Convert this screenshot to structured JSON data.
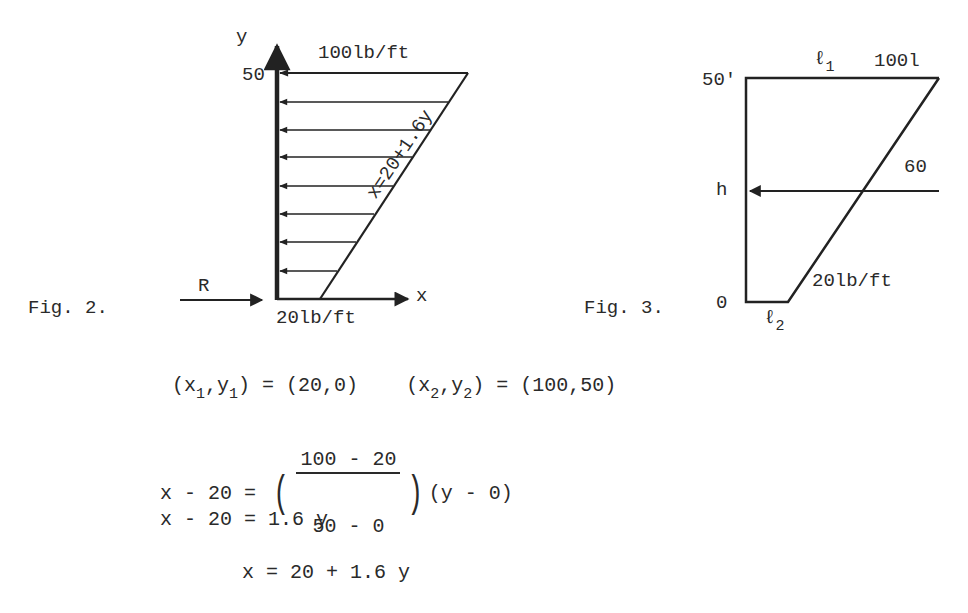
{
  "fig2": {
    "caption": "Fig. 2.",
    "y_axis_label": "y",
    "x_axis_label": "x",
    "y_tick": "50",
    "top_load": "100lb/ft",
    "bottom_load": "20lb/ft",
    "line_equation": "x=20+1.6y",
    "reaction_label": "R",
    "arrow_count": 8
  },
  "fig3": {
    "caption": "Fig. 3.",
    "top_tick": "50'",
    "mid_tick": "h",
    "bottom_tick": "0",
    "top_load": "100l",
    "mid_load": "60",
    "bottom_load": "20lb/ft",
    "l1_label": "ℓ",
    "l1_sub": "1",
    "l2_label": "ℓ",
    "l2_sub": "2"
  },
  "equations": {
    "line1": {
      "p1_open": "(x",
      "p1_sub_x": "1",
      "p1_mid": ",y",
      "p1_sub_y": "1",
      "p1_close": ") = (20,0)",
      "p2_open": "(x",
      "p2_sub_x": "2",
      "p2_mid": ",y",
      "p2_sub_y": "2",
      "p2_close": ") = (100,50)"
    },
    "line2": {
      "lhs": "x - 20 = ",
      "numerator": "100 - 20",
      "denominator": "50 - 0",
      "rhs": "(y - 0)"
    },
    "line3": "x - 20 = 1.6 y",
    "line4": "x = 20 + 1.6 y"
  }
}
